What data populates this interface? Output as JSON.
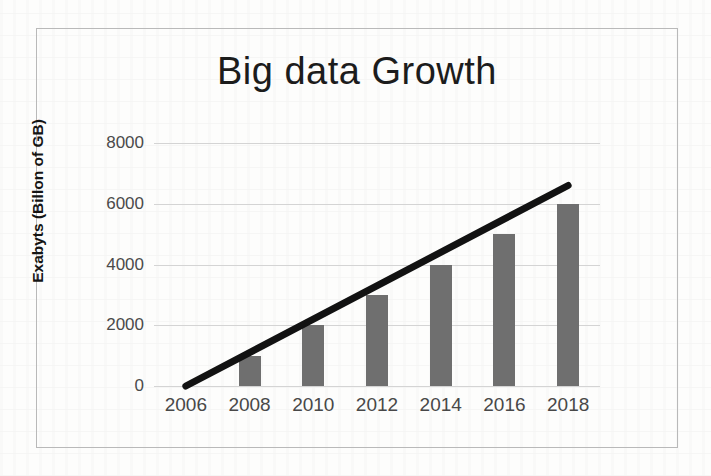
{
  "chart_data": {
    "type": "bar",
    "title": "Big data  Growth",
    "xlabel": "",
    "ylabel": "Exabyts (Billon of GB)",
    "categories": [
      "2006",
      "2008",
      "2010",
      "2012",
      "2014",
      "2016",
      "2018"
    ],
    "values": [
      0,
      1000,
      2000,
      3000,
      4000,
      5000,
      6000
    ],
    "ylim": [
      0,
      8000
    ],
    "yticks": [
      0,
      2000,
      4000,
      6000,
      8000
    ],
    "ytick_labels": [
      "0",
      "2000",
      "4000",
      "6000",
      "8000"
    ],
    "grid": true,
    "legend": false,
    "series": [
      {
        "name": "Exabyts",
        "type": "bar",
        "color": "#6f6f6f",
        "values": [
          0,
          1000,
          2000,
          3000,
          4000,
          5000,
          6000
        ]
      },
      {
        "name": "Trend",
        "type": "line",
        "color": "#121212",
        "x": [
          "2006",
          "2018"
        ],
        "values": [
          0,
          6600
        ]
      }
    ]
  },
  "colors": {
    "bar_fill": "#6f6f6f",
    "trend_line": "#121212",
    "gridline": "#d4d4d4",
    "frame_border": "#b9b9b9",
    "title_text": "#1c1c1c",
    "tick_text": "#4a4a4a",
    "page_background": "#fdfdfc"
  }
}
